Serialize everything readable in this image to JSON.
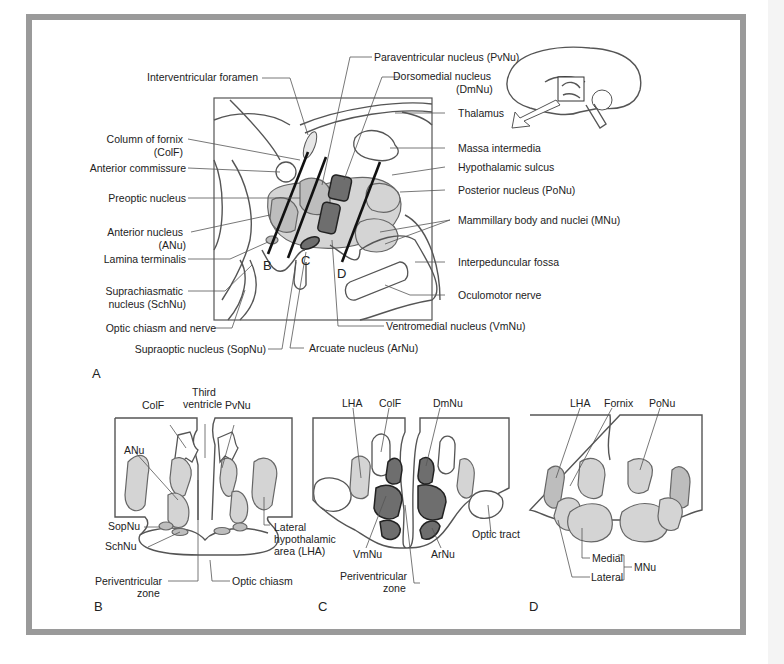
{
  "figure": {
    "panel_labels": {
      "A": "A",
      "B": "B",
      "C": "C",
      "D": "D"
    },
    "cut_planes": {
      "B": "B",
      "C": "C",
      "D": "D"
    },
    "panelA": {
      "left_labels": [
        "Interventricular foramen",
        "Column of fornix",
        "(ColF)",
        "Anterior commissure",
        "Preoptic nucleus",
        "Anterior nucleus",
        "(ANu)",
        "Lamina terminalis",
        "Suprachiasmatic",
        "nucleus (SchNu)",
        "Optic chiasm and nerve",
        "Supraoptic nucleus (SopNu)"
      ],
      "top_labels": [
        "Paraventricular nucleus (PvNu)",
        "Dorsomedial nucleus",
        "(DmNu)"
      ],
      "right_labels": [
        "Thalamus",
        "Massa intermedia",
        "Hypothalamic sulcus",
        "Posterior nucleus (PoNu)",
        "Mammillary body and nuclei (MNu)",
        "Interpeduncular fossa",
        "Oculomotor nerve"
      ],
      "bottom_labels": [
        "Ventromedial nucleus (VmNu)",
        "Arcuate nucleus (ArNu)"
      ]
    },
    "panelB": {
      "labels": [
        "ColF",
        "Third",
        "ventricle",
        "PvNu",
        "ANu",
        "SopNu",
        "SchNu",
        "Lateral",
        "hypothalamic",
        "area (LHA)",
        "Periventricular",
        "zone",
        "Optic chiasm"
      ]
    },
    "panelC": {
      "labels": [
        "LHA",
        "ColF",
        "DmNu",
        "VmNu",
        "ArNu",
        "Optic tract",
        "Periventricular",
        "zone"
      ]
    },
    "panelD": {
      "labels": [
        "LHA",
        "Fornix",
        "PoNu",
        "Medial",
        "Lateral",
        "MNu"
      ]
    }
  },
  "colors": {
    "frame_border": "#9a9a9a",
    "light_fill": "#d4d4d4",
    "medium_fill": "#bdbdbd",
    "dark_fill": "#6e6e6e"
  }
}
